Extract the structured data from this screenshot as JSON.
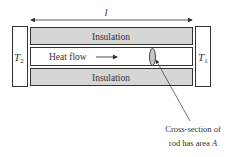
{
  "diagram": {
    "length_label": "l",
    "left_temp": {
      "symbol": "T",
      "sub": "2"
    },
    "right_temp": {
      "symbol": "T",
      "sub": "1"
    },
    "top_insulation_label": "Insulation",
    "bottom_insulation_label": "Insulation",
    "heat_flow_label": "Heat flow",
    "caption_line1": "Cross-section of",
    "caption_line2_prefix": "rod has area ",
    "caption_line2_var": "A"
  },
  "colors": {
    "insulation_fill": "#d6d6d6",
    "stroke": "#333333",
    "rod_fill": "#ffffff",
    "ellipse_fill": "#c8c8c8"
  }
}
